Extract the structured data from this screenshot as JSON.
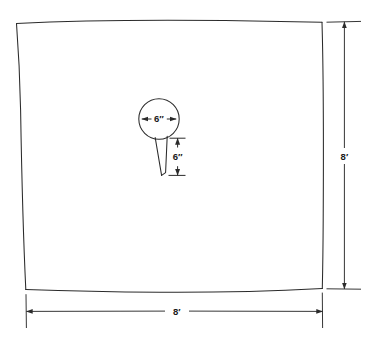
{
  "drawing": {
    "type": "technical-plan-drawing",
    "description": "Hand-drawn square slab plan with circular hole and tapered slot",
    "background_color": "#ffffff",
    "line_color": "#2b2b2b",
    "slab": {
      "name": "square-slab-outline",
      "shape": "square",
      "width_label": "8′",
      "height_label": "8′"
    },
    "circle": {
      "name": "circular-hole",
      "diameter_label": "6″"
    },
    "slot": {
      "name": "tapered-slot",
      "length_label": "6″"
    },
    "dimensions": [
      {
        "id": "right-vertical-dimension",
        "label": "8′",
        "orientation": "vertical",
        "position": "right"
      },
      {
        "id": "bottom-horizontal-dimension",
        "label": "8′",
        "orientation": "horizontal",
        "position": "bottom"
      },
      {
        "id": "circle-diameter-dimension",
        "label": "6″",
        "orientation": "horizontal",
        "position": "inside-circle"
      },
      {
        "id": "slot-length-dimension",
        "label": "6″",
        "orientation": "vertical",
        "position": "right-of-slot"
      }
    ]
  }
}
